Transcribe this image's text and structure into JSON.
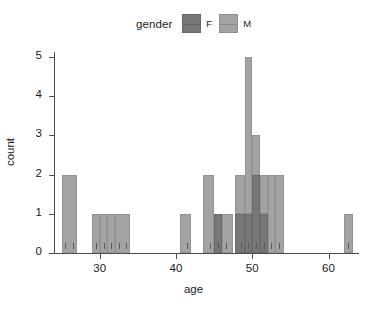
{
  "legend": {
    "title": "gender",
    "keys": [
      {
        "label": "F",
        "color": "#777777"
      },
      {
        "label": "M",
        "color": "#a3a3a3"
      }
    ]
  },
  "axes": {
    "x_title": "age",
    "y_title": "count",
    "x_ticks": [
      30,
      40,
      50,
      60
    ],
    "y_ticks": [
      0,
      1,
      2,
      3,
      4,
      5
    ]
  },
  "chart_data": {
    "type": "bar",
    "subtype": "stacked-histogram",
    "title": "",
    "xlabel": "age",
    "ylabel": "count",
    "xlim": [
      24,
      64
    ],
    "ylim": [
      0,
      5
    ],
    "grid": false,
    "legend_title": "gender",
    "legend_position": "top",
    "bin_width": 1,
    "colors": {
      "F": "#777777",
      "M": "#a3a3a3"
    },
    "categories": [
      25,
      26,
      29,
      30,
      31,
      32,
      33,
      41,
      44,
      45,
      46,
      48,
      49,
      50,
      51,
      52,
      53,
      62
    ],
    "series": [
      {
        "name": "F",
        "values": [
          0,
          0,
          0,
          0,
          0,
          0,
          0,
          0,
          0,
          1,
          0,
          1,
          1,
          2,
          1,
          0,
          0,
          0
        ]
      },
      {
        "name": "M",
        "values": [
          1,
          1,
          1,
          1,
          1,
          1,
          1,
          1,
          2,
          0,
          1,
          1,
          4,
          1,
          1,
          2,
          2,
          1
        ]
      }
    ],
    "totals": [
      1,
      1,
      1,
      1,
      1,
      1,
      1,
      1,
      2,
      1,
      1,
      2,
      5,
      3,
      2,
      2,
      2,
      1
    ],
    "rug_values": [
      25,
      26,
      29,
      30,
      31,
      32,
      33,
      41,
      44,
      45,
      46,
      48,
      49,
      50,
      51,
      52,
      53,
      62
    ]
  },
  "bars": [
    {
      "x0": 25,
      "x1": 27,
      "base": 0,
      "top": 2,
      "gender": "M"
    },
    {
      "x0": 29,
      "x1": 30,
      "base": 0,
      "top": 1,
      "gender": "M"
    },
    {
      "x0": 30,
      "x1": 31,
      "base": 0,
      "top": 1,
      "gender": "M"
    },
    {
      "x0": 31,
      "x1": 32,
      "base": 0,
      "top": 1,
      "gender": "M"
    },
    {
      "x0": 32,
      "x1": 34,
      "base": 0,
      "top": 1,
      "gender": "M"
    },
    {
      "x0": 40.5,
      "x1": 42,
      "base": 0,
      "top": 1,
      "gender": "M"
    },
    {
      "x0": 43.5,
      "x1": 45,
      "base": 0,
      "top": 2,
      "gender": "M"
    },
    {
      "x0": 45,
      "x1": 46,
      "base": 0,
      "top": 1,
      "gender": "F"
    },
    {
      "x0": 46,
      "x1": 47.5,
      "base": 0,
      "top": 1,
      "gender": "M"
    },
    {
      "x0": 47.8,
      "x1": 49,
      "base": 0,
      "top": 1,
      "gender": "F"
    },
    {
      "x0": 47.8,
      "x1": 49,
      "base": 1,
      "top": 2,
      "gender": "M"
    },
    {
      "x0": 49,
      "x1": 50,
      "base": 0,
      "top": 1,
      "gender": "F"
    },
    {
      "x0": 49,
      "x1": 50,
      "base": 1,
      "top": 5,
      "gender": "M"
    },
    {
      "x0": 50,
      "x1": 51,
      "base": 0,
      "top": 2,
      "gender": "F"
    },
    {
      "x0": 50,
      "x1": 51,
      "base": 2,
      "top": 3,
      "gender": "M"
    },
    {
      "x0": 51,
      "x1": 52,
      "base": 0,
      "top": 1,
      "gender": "F"
    },
    {
      "x0": 51,
      "x1": 52,
      "base": 1,
      "top": 2,
      "gender": "M"
    },
    {
      "x0": 52,
      "x1": 53,
      "base": 0,
      "top": 2,
      "gender": "M"
    },
    {
      "x0": 53,
      "x1": 54.2,
      "base": 0,
      "top": 2,
      "gender": "M"
    },
    {
      "x0": 62,
      "x1": 63.2,
      "base": 0,
      "top": 1,
      "gender": "M"
    }
  ]
}
